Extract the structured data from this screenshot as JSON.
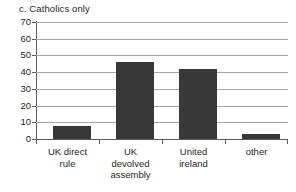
{
  "figure": {
    "title": "c. Catholics only",
    "background": "#ffffff",
    "bar_color": "#383838",
    "gridline_color": "#a6a6a6",
    "axis_color": "#5b5b5b",
    "text_color": "#231f20"
  },
  "chart_data": {
    "type": "bar",
    "title": "c. Catholics only",
    "subtitle": "",
    "xlabel": "",
    "ylabel": "",
    "categories": [
      "UK direct rule",
      "UK devolved assembly",
      "United ireland",
      "other"
    ],
    "category_lines": [
      [
        "UK direct",
        "rule"
      ],
      [
        "UK",
        "devolved",
        "assembly"
      ],
      [
        "United",
        "ireland"
      ],
      [
        "other"
      ]
    ],
    "values": [
      8,
      46,
      42,
      3
    ],
    "ylim": [
      0,
      70
    ],
    "ytick_values": [
      0,
      10,
      20,
      30,
      40,
      50,
      60,
      70
    ],
    "ytick_labels": [
      "0",
      "10",
      "20",
      "30",
      "40",
      "50",
      "60",
      "70"
    ],
    "grid": true,
    "grid_axis": "y",
    "legend": false,
    "legend_position": "none",
    "annotations": []
  }
}
